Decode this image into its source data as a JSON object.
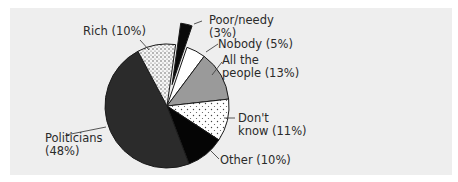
{
  "chart_data": {
    "type": "pie",
    "title": "",
    "categories": [
      "Poor/needy",
      "Nobody",
      "All the people",
      "Don't know",
      "Other",
      "Politicians",
      "Rich"
    ],
    "values": [
      3,
      5,
      13,
      11,
      10,
      48,
      10
    ],
    "unit": "%",
    "exploded": [
      "Poor/needy"
    ],
    "slices": [
      {
        "name": "Poor/needy",
        "value": 3,
        "label_line1": "Poor/needy",
        "label_line2": "(3%)",
        "fill": "#0a0a0a",
        "pattern": "solid"
      },
      {
        "name": "Nobody",
        "value": 5,
        "label_line1": "Nobody (5%)",
        "label_line2": "",
        "fill": "#ffffff",
        "pattern": "solid"
      },
      {
        "name": "All the people",
        "value": 13,
        "label_line1": "All the",
        "label_line2": "people (13%)",
        "fill": "#9a9a9a",
        "pattern": "solid"
      },
      {
        "name": "Don't know",
        "value": 11,
        "label_line1": "Don't",
        "label_line2": "know (11%)",
        "fill": "#ffffff",
        "pattern": "sparse-dots"
      },
      {
        "name": "Other",
        "value": 10,
        "label_line1": "Other (10%)",
        "label_line2": "",
        "fill": "#050505",
        "pattern": "solid"
      },
      {
        "name": "Politicians",
        "value": 48,
        "label_line1": "Politicians",
        "label_line2": "(48%)",
        "fill": "#2b2b2b",
        "pattern": "solid"
      },
      {
        "name": "Rich",
        "value": 10,
        "label_line1": "Rich (10%)",
        "label_line2": "",
        "fill": "#f4f4f4",
        "pattern": "dense-dots"
      }
    ],
    "legend": "none (direct labels with leader lines)"
  }
}
